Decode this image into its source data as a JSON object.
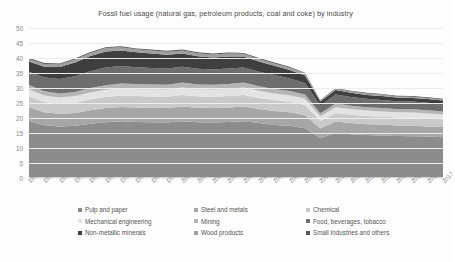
{
  "chart_data": {
    "type": "area",
    "stacked": true,
    "title": "Fossil fuel usage (natural gas, petroleum products, coal and coke) by industry",
    "xlabel": "",
    "ylabel": "",
    "ylim": [
      0,
      50
    ],
    "yticks": [
      0,
      5,
      10,
      15,
      20,
      25,
      30,
      35,
      40,
      45,
      50
    ],
    "grid": true,
    "legend_position": "bottom",
    "categories": [
      "1990",
      "1991",
      "1992",
      "1993",
      "1994",
      "1995",
      "1996",
      "1997",
      "1998",
      "1999",
      "2000",
      "2001",
      "2002",
      "2003",
      "2004",
      "2005",
      "2006",
      "2007",
      "2008",
      "2009",
      "2010",
      "2011",
      "2012",
      "2013",
      "2014",
      "2015",
      "2016",
      "2017"
    ],
    "series": [
      {
        "name": "Pulp and paper",
        "color": "#8c8c8c",
        "values": [
          19.0,
          17.6,
          17.2,
          17.4,
          18.1,
          18.6,
          18.9,
          18.7,
          18.6,
          18.5,
          18.9,
          18.6,
          18.5,
          18.7,
          18.9,
          18.3,
          17.7,
          17.4,
          16.6,
          13.3,
          15.0,
          14.6,
          14.3,
          14.2,
          14.0,
          13.9,
          13.8,
          13.6
        ]
      },
      {
        "name": "Steel and metals",
        "color": "#a6a6a6",
        "values": [
          4.6,
          4.3,
          4.2,
          4.3,
          4.5,
          4.7,
          4.8,
          4.8,
          4.8,
          4.8,
          4.9,
          4.8,
          4.8,
          4.8,
          4.9,
          4.7,
          4.6,
          4.5,
          4.3,
          3.2,
          3.8,
          3.7,
          3.6,
          3.6,
          3.5,
          3.5,
          3.4,
          3.4
        ]
      },
      {
        "name": "Chemical",
        "color": "#c9c9c9",
        "values": [
          3.6,
          3.4,
          3.3,
          3.4,
          3.6,
          3.7,
          3.8,
          3.8,
          3.8,
          3.8,
          3.9,
          3.8,
          3.8,
          3.8,
          3.9,
          3.7,
          3.6,
          3.5,
          3.4,
          2.5,
          2.9,
          2.8,
          2.8,
          2.7,
          2.7,
          2.7,
          2.6,
          2.6
        ]
      },
      {
        "name": "Mechanical engineering",
        "color": "#e3e3e3",
        "values": [
          2.3,
          2.2,
          2.1,
          2.2,
          2.3,
          2.4,
          2.4,
          2.4,
          2.4,
          2.4,
          2.5,
          2.4,
          2.4,
          2.4,
          2.5,
          2.4,
          2.3,
          2.2,
          2.1,
          1.6,
          1.9,
          1.8,
          1.8,
          1.7,
          1.7,
          1.7,
          1.7,
          1.6
        ]
      },
      {
        "name": "Mining",
        "color": "#b5b5b5",
        "values": [
          1.5,
          1.4,
          1.4,
          1.4,
          1.5,
          1.5,
          1.6,
          1.6,
          1.6,
          1.6,
          1.6,
          1.6,
          1.6,
          1.6,
          1.6,
          1.5,
          1.5,
          1.4,
          1.4,
          1.0,
          1.2,
          1.2,
          1.1,
          1.1,
          1.1,
          1.1,
          1.1,
          1.0
        ]
      },
      {
        "name": "Food, beverages, tobacco",
        "color": "#6e6e6e",
        "values": [
          4.4,
          4.6,
          4.8,
          5.2,
          5.6,
          5.9,
          5.8,
          5.6,
          5.5,
          5.4,
          5.3,
          5.2,
          5.1,
          5.2,
          5.0,
          4.8,
          4.6,
          4.2,
          3.9,
          2.6,
          3.0,
          2.9,
          2.8,
          2.7,
          2.6,
          2.6,
          2.5,
          2.5
        ]
      },
      {
        "name": "Non-metallic minerals",
        "color": "#3f3f3f",
        "values": [
          3.4,
          3.6,
          4.0,
          4.6,
          5.1,
          5.4,
          5.2,
          5.0,
          4.8,
          4.6,
          4.4,
          4.2,
          4.0,
          4.0,
          3.7,
          3.4,
          3.1,
          2.8,
          2.5,
          1.3,
          1.5,
          1.4,
          1.3,
          1.3,
          1.2,
          1.2,
          1.2,
          1.1
        ]
      },
      {
        "name": "Wood products",
        "color": "#9f9f9f",
        "values": [
          0.9,
          0.9,
          0.9,
          1.0,
          1.0,
          1.1,
          1.1,
          1.0,
          1.0,
          1.0,
          1.0,
          1.0,
          1.0,
          1.0,
          0.9,
          0.9,
          0.8,
          0.8,
          0.7,
          0.4,
          0.5,
          0.5,
          0.5,
          0.5,
          0.4,
          0.4,
          0.4,
          0.4
        ]
      },
      {
        "name": "Small Industries and others",
        "color": "#565656",
        "values": [
          0.3,
          0.3,
          0.3,
          0.3,
          0.3,
          0.3,
          0.3,
          0.3,
          0.3,
          0.3,
          0.3,
          0.3,
          0.3,
          0.3,
          0.3,
          0.3,
          0.3,
          0.3,
          0.2,
          0.1,
          0.2,
          0.2,
          0.2,
          0.2,
          0.2,
          0.2,
          0.2,
          0.2
        ]
      }
    ]
  },
  "legend": {
    "rows": [
      [
        {
          "label": "Pulp and paper",
          "color": "#8c8c8c"
        },
        {
          "label": "Steel and metals",
          "color": "#a6a6a6"
        },
        {
          "label": "Chemical",
          "color": "#c9c9c9"
        }
      ],
      [
        {
          "label": "Mechanical engineering",
          "color": "#e3e3e3"
        },
        {
          "label": "Mining",
          "color": "#b5b5b5"
        },
        {
          "label": "Food, beverages, tobacco",
          "color": "#6e6e6e"
        }
      ],
      [
        {
          "label": "Non-metallic minerals",
          "color": "#3f3f3f"
        },
        {
          "label": "Wood products",
          "color": "#9f9f9f"
        },
        {
          "label": "Small Industries and others",
          "color": "#565656"
        }
      ]
    ]
  }
}
